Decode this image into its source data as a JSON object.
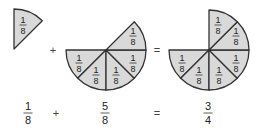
{
  "diagram": {
    "colors": {
      "fill": "#d9d9d9",
      "stroke": "#333333",
      "text": "#222222"
    },
    "figures": [
      {
        "name": "one-eighth",
        "pieces": 1,
        "piece_label": {
          "num": "1",
          "den": "8"
        }
      },
      {
        "name": "five-eighths",
        "pieces": 5,
        "piece_label": {
          "num": "1",
          "den": "8"
        }
      },
      {
        "name": "six-eighths",
        "pieces": 6,
        "piece_label": {
          "num": "1",
          "den": "8"
        }
      }
    ],
    "operators": {
      "plus": "+",
      "equals": "="
    },
    "equation": {
      "term1": {
        "num": "1",
        "den": "8"
      },
      "term2": {
        "num": "5",
        "den": "8"
      },
      "result": {
        "num": "3",
        "den": "4"
      }
    }
  }
}
